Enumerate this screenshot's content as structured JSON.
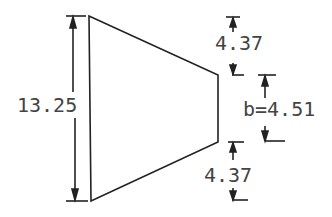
{
  "diagram": {
    "type": "trapezoid cross-section dimension drawing",
    "left_height_label": "13.25",
    "top_offset_label": "4.37",
    "bottom_offset_label": "4.37",
    "right_width_label": "b=4.51",
    "colors": {
      "line": "#222222",
      "text": "#444444",
      "background": "#ffffff"
    }
  }
}
